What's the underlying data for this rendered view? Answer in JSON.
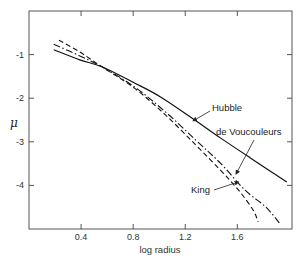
{
  "chart_data": {
    "type": "line",
    "title": "",
    "xlabel": "log radius",
    "ylabel": "μ",
    "xlim": [
      0.0,
      2.02
    ],
    "ylim": [
      -5.0,
      0.0
    ],
    "grid": false,
    "legend": "inline labels with arrows",
    "x_ticks": [
      0.4,
      0.8,
      1.2,
      1.6
    ],
    "x_tick_labels": [
      "0.4",
      "0.8",
      "1.2",
      "1.6"
    ],
    "y_ticks": [
      -1,
      -2,
      -3,
      -4
    ],
    "y_tick_labels": [
      "-1",
      "-2",
      "-3",
      "-4"
    ],
    "series": [
      {
        "name": "Hubble",
        "style": "solid",
        "x": [
          0.19,
          0.39,
          0.56,
          0.81,
          1.01,
          1.24,
          1.47,
          1.7,
          1.98
        ],
        "y": [
          -0.89,
          -1.12,
          -1.28,
          -1.65,
          -1.97,
          -2.43,
          -2.91,
          -3.37,
          -3.92
        ]
      },
      {
        "name": "de Voucouleurs",
        "style": "dashdot",
        "x": [
          0.19,
          0.39,
          0.56,
          0.81,
          1.05,
          1.28,
          1.47,
          1.66,
          1.82,
          1.93
        ],
        "y": [
          -0.76,
          -1.03,
          -1.28,
          -1.74,
          -2.32,
          -2.96,
          -3.49,
          -4.11,
          -4.5,
          -4.89
        ]
      },
      {
        "name": "King",
        "style": "dashed",
        "x": [
          0.23,
          0.39,
          0.56,
          0.81,
          1.05,
          1.28,
          1.47,
          1.61,
          1.72,
          1.76
        ],
        "y": [
          -0.67,
          -0.94,
          -1.28,
          -1.77,
          -2.39,
          -3.07,
          -3.65,
          -4.11,
          -4.56,
          -4.84
        ]
      }
    ],
    "annotations": [
      {
        "text": "Hubble",
        "arrow_to": [
          1.26,
          -2.52
        ]
      },
      {
        "text": "de Voucouleurs",
        "arrow_to": [
          1.59,
          -3.74
        ]
      },
      {
        "text": "King",
        "arrow_to": [
          1.61,
          -3.92
        ]
      }
    ]
  },
  "labels": {
    "xlabel": "log radius",
    "ylabel": "μ",
    "hubble": "Hubble",
    "devauc": "de Voucouleurs",
    "king": "King"
  }
}
